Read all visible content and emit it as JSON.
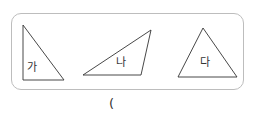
{
  "shapes": [
    {
      "label": "가",
      "type": "right-triangle",
      "points": "23,25 23,80 64,80"
    },
    {
      "label": "나",
      "type": "obtuse-triangle",
      "points": "83,75 151,30 141,75"
    },
    {
      "label": "다",
      "type": "acute-triangle",
      "points": "203,28 178,77 237,77"
    }
  ],
  "answer": {
    "open_paren": "("
  },
  "colors": {
    "stroke": "#333333",
    "panel_border": "#bdbdbd"
  }
}
